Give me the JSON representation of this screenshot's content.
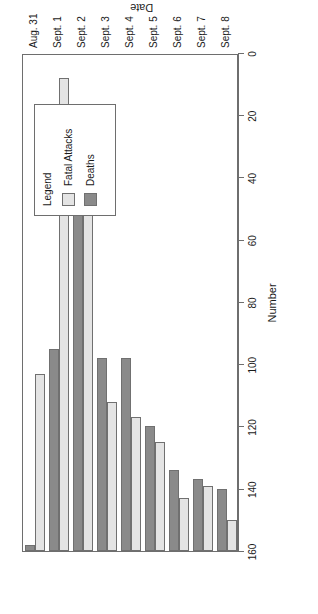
{
  "chart_data": {
    "type": "bar",
    "orientation": "horizontal",
    "title": "",
    "xlabel": "Date",
    "ylabel": "Number",
    "categories": [
      "Aug. 31",
      "Sept. 1",
      "Sept. 2",
      "Sept. 3",
      "Sept. 4",
      "Sept. 5",
      "Sept. 6",
      "Sept. 7",
      "Sept. 8"
    ],
    "series": [
      {
        "name": "Fatal Attacks",
        "color": "#e4e4e4",
        "values": [
          57,
          152,
          116,
          48,
          43,
          35,
          17,
          21,
          10
        ]
      },
      {
        "name": "Deaths",
        "color": "#8a8a8a",
        "values": [
          2,
          65,
          121,
          62,
          62,
          40,
          26,
          23,
          20
        ]
      }
    ],
    "ylim": [
      0,
      160
    ],
    "yticks": [
      0,
      20,
      40,
      60,
      80,
      100,
      120,
      140,
      160
    ],
    "ytick_labels": [
      "0",
      "20",
      "40",
      "60",
      "80",
      "100",
      "120",
      "140",
      "160"
    ],
    "grid": false,
    "legend_position": "top-right"
  },
  "legend": {
    "title": "Legend",
    "entries": [
      {
        "label": "Fatal Attacks",
        "swatch": "light-gray-swatch"
      },
      {
        "label": "Deaths",
        "swatch": "dark-gray-swatch"
      }
    ]
  },
  "axes": {
    "value_axis_title": "Number",
    "category_axis_title": "Date"
  }
}
